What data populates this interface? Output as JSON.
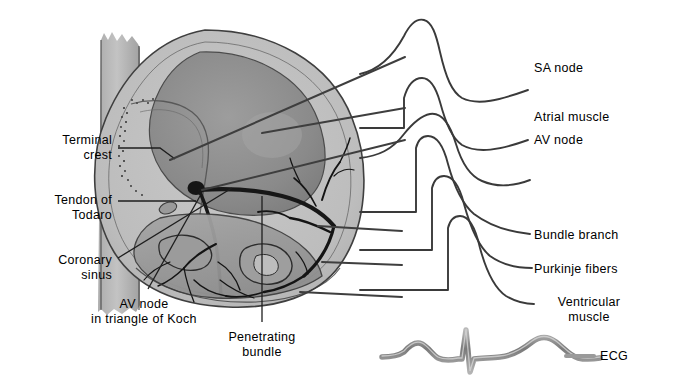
{
  "figure": {
    "width": 685,
    "height": 388,
    "background_color": "#ffffff",
    "line_color": "#3a3a3a",
    "text_color": "#000000",
    "ecg_color": "#8c8c8c"
  },
  "labels_left": [
    {
      "id": "terminal-crest",
      "text": "Terminal\ncrest",
      "x": 112,
      "y": 133,
      "align": "right"
    },
    {
      "id": "tendon-of-todaro",
      "text": "Tendon of\nTodaro",
      "x": 112,
      "y": 193,
      "align": "right"
    },
    {
      "id": "coronary-sinus",
      "text": "Coronary\nsinus",
      "x": 112,
      "y": 253,
      "align": "right"
    }
  ],
  "labels_bottom": [
    {
      "id": "av-node-triangle-of-koch",
      "text": "AV node\nin triangle of Koch",
      "x": 144,
      "y": 297,
      "align": "center"
    },
    {
      "id": "penetrating-bundle",
      "text": "Penetrating\nbundle",
      "x": 262,
      "y": 330,
      "align": "center"
    }
  ],
  "labels_right": [
    {
      "id": "sa-node",
      "text": "SA node",
      "x": 534,
      "y": 61,
      "align": "left"
    },
    {
      "id": "atrial-muscle",
      "text": "Atrial muscle",
      "x": 534,
      "y": 110,
      "align": "left"
    },
    {
      "id": "av-node",
      "text": "AV node",
      "x": 534,
      "y": 133,
      "align": "left"
    },
    {
      "id": "bundle-branch",
      "text": "Bundle branch",
      "x": 534,
      "y": 228,
      "align": "left"
    },
    {
      "id": "purkinje-fibers",
      "text": "Purkinje fibers",
      "x": 534,
      "y": 262,
      "align": "left"
    },
    {
      "id": "ventricular-muscle",
      "text": "Ventricular\nmuscle",
      "x": 534,
      "y": 295,
      "align": "left"
    },
    {
      "id": "ecg",
      "text": "ECG",
      "x": 600,
      "y": 349,
      "align": "left"
    }
  ],
  "waveforms": [
    {
      "id": "sa-node-potential",
      "name": "SA node action potential"
    },
    {
      "id": "atrial-muscle-potential",
      "name": "Atrial muscle action potential"
    },
    {
      "id": "av-node-potential",
      "name": "AV node action potential"
    },
    {
      "id": "bundle-branch-potential",
      "name": "Bundle branch action potential"
    },
    {
      "id": "purkinje-fibers-potential",
      "name": "Purkinje fibers action potential"
    },
    {
      "id": "ventricular-muscle-potential",
      "name": "Ventricular muscle action potential"
    },
    {
      "id": "ecg-trace",
      "name": "ECG trace with P wave, QRS complex and T wave"
    }
  ],
  "anatomy": {
    "heart_label": "Right atrium and right ventricle cutaway",
    "vena_cava_label": "Superior and inferior vena cava",
    "conduction_label": "Atrioventricular conduction bundle and Purkinje network"
  }
}
